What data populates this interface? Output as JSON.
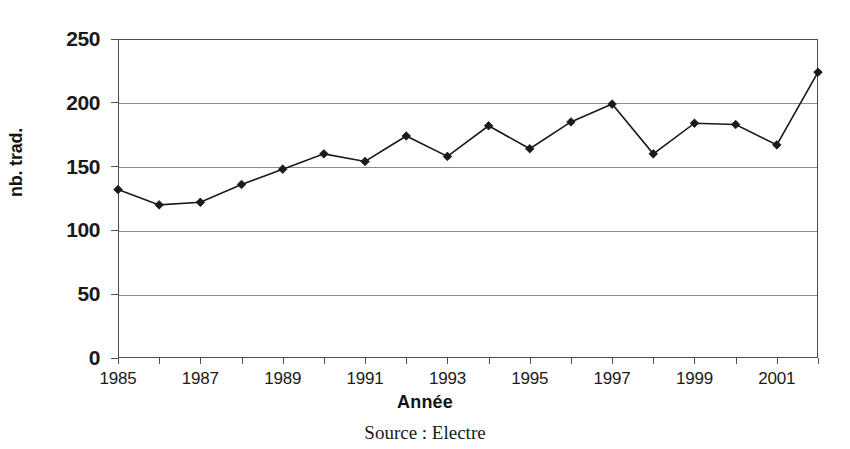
{
  "chart_data": {
    "type": "line",
    "title": "",
    "xlabel": "Année",
    "ylabel": "nb. trad.",
    "categories": [
      1985,
      1986,
      1987,
      1988,
      1989,
      1990,
      1991,
      1992,
      1993,
      1994,
      1995,
      1996,
      1997,
      1998,
      1999,
      2000,
      2001,
      2002
    ],
    "values": [
      132,
      120,
      122,
      136,
      148,
      160,
      154,
      174,
      158,
      182,
      164,
      185,
      199,
      160,
      184,
      183,
      167,
      224
    ],
    "series": [
      {
        "name": "nb. trad.",
        "values": [
          132,
          120,
          122,
          136,
          148,
          160,
          154,
          174,
          158,
          182,
          164,
          185,
          199,
          160,
          184,
          183,
          167,
          224
        ]
      }
    ],
    "xlim": [
      1985,
      2002
    ],
    "ylim": [
      0,
      250
    ],
    "y_ticks": [
      0,
      50,
      100,
      150,
      200,
      250
    ],
    "y_tick_labels": [
      "0",
      "50",
      "100",
      "150",
      "200",
      "250"
    ],
    "x_ticks": [
      1985,
      1986,
      1987,
      1988,
      1989,
      1990,
      1991,
      1992,
      1993,
      1994,
      1995,
      1996,
      1997,
      1998,
      1999,
      2000,
      2001,
      2002
    ],
    "x_tick_labels": [
      "1985",
      "",
      "1987",
      "",
      "1989",
      "",
      "1991",
      "",
      "1993",
      "",
      "1995",
      "",
      "1997",
      "",
      "1999",
      "",
      "2001",
      ""
    ],
    "grid": true,
    "grid_axis": "y",
    "legend": false,
    "marker": "diamond",
    "line_color": "#1a1a1a",
    "marker_color": "#1a1a1a",
    "grid_color": "#8c8c8c",
    "axis_color": "#4d4d4d",
    "background": "#ffffff"
  },
  "source": {
    "text": "Source : Electre"
  }
}
